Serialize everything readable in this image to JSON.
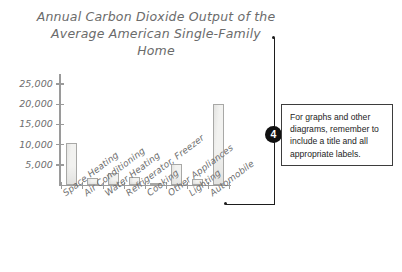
{
  "chart_data": {
    "type": "bar",
    "title": "Annual Carbon Dioxide Output of the\nAverage American Single-Family Home",
    "xlabel": "",
    "ylabel": "",
    "ylim": [
      0,
      27500
    ],
    "grid": false,
    "legend": null,
    "y_ticks": [
      5000,
      10000,
      15000,
      20000,
      25000
    ],
    "y_tick_labels": [
      "5,000",
      "10,000",
      "15,000",
      "20,000",
      "25,000"
    ],
    "categories": [
      "Space Heating",
      "Air Conditioning",
      "Water Heating",
      "Refrigerator, Freezer",
      "Cooking",
      "Other Appliances",
      "Lighting",
      "Automobile"
    ],
    "values": [
      10400,
      1800,
      2900,
      2100,
      500,
      5200,
      1600,
      20000
    ]
  },
  "callout": {
    "number": "4",
    "text": "For graphs and other diagrams, remember to include a title and all appropriate labels."
  },
  "colors": {
    "bar_fill": "#f2f2f0",
    "bar_stroke": "#a8a8a6",
    "axis": "#9a9a9a",
    "handwriting": "#6e6e6e",
    "callout_ink": "#1d1d1d",
    "marker_bg": "#111111",
    "background": "#ffffff"
  }
}
